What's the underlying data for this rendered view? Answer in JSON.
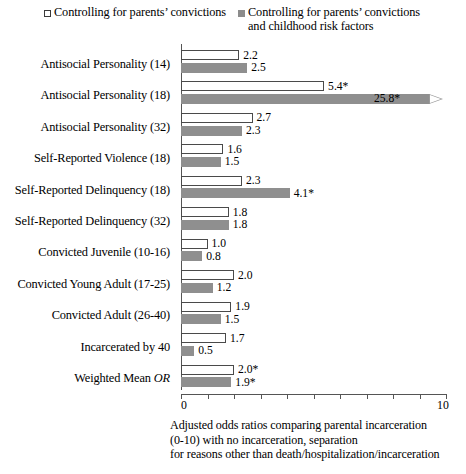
{
  "legend": {
    "series": [
      {
        "key": "open",
        "label": "Controlling for parents’ convictions",
        "marker": "open-square-icon",
        "color": "#ffffff"
      },
      {
        "key": "fill",
        "label": "Controlling for parents’ convictions\nand childhood risk factors",
        "marker": "filled-square-icon",
        "color": "#8f8f8f"
      }
    ]
  },
  "axis": {
    "ticks": [
      0,
      1,
      2,
      3,
      4,
      5,
      6,
      7,
      8,
      9,
      10
    ],
    "tick_labels_shown": [
      "0",
      "10"
    ],
    "min_label": "0",
    "max_label": "10"
  },
  "caption": {
    "text": "Adjusted odds ratios comparing parental incarceration\n(0-10) with no incarceration, separation\nfor reasons other than death/hospitalization/incarceration"
  },
  "chart_data": {
    "type": "bar",
    "orientation": "horizontal",
    "title": "",
    "xlabel": "",
    "ylabel": "",
    "xlim": [
      0,
      10
    ],
    "grid": false,
    "legend_position": "top",
    "categories": [
      "Antisocial Personality (14)",
      "Antisocial Personality (18)",
      "Antisocial Personality (32)",
      "Self-Reported Violence (18)",
      "Self-Reported Delinquency (18)",
      "Self-Reported Delinquency (32)",
      "Convicted Juvenile (10-16)",
      "Convicted Young Adult (17-25)",
      "Convicted Adult (26-40)",
      "Incarcerated by 40",
      "Weighted Mean OR"
    ],
    "series": [
      {
        "name": "Controlling for parents’ convictions",
        "color": "#ffffff",
        "values": [
          2.2,
          5.4,
          2.7,
          1.6,
          2.3,
          1.8,
          1.0,
          2.0,
          1.9,
          1.7,
          2.0
        ],
        "labels": [
          "2.2",
          "5.4*",
          "2.7",
          "1.6",
          "2.3",
          "1.8",
          "1.0",
          "2.0",
          "1.9",
          "1.7",
          "2.0*"
        ]
      },
      {
        "name": "Controlling for parents’ convictions and childhood risk factors",
        "color": "#8f8f8f",
        "values": [
          2.5,
          25.8,
          2.3,
          1.5,
          4.1,
          1.8,
          0.8,
          1.2,
          1.5,
          0.5,
          1.9
        ],
        "labels": [
          "2.5",
          "25.8*",
          "2.3",
          "1.5",
          "4.1*",
          "1.8",
          "0.8",
          "1.2",
          "1.5",
          "0.5",
          "1.9*"
        ],
        "truncated": [
          false,
          true,
          false,
          false,
          false,
          false,
          false,
          false,
          false,
          false,
          false
        ]
      }
    ],
    "note": "Bar for Antisocial Personality (18) in the second series is truncated at the axis maximum and drawn with an arrowhead."
  }
}
